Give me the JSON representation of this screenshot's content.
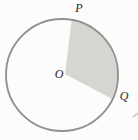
{
  "figure": {
    "labels": {
      "p": "P",
      "o": "O",
      "q": "Q"
    },
    "colors": {
      "circle_stroke": "#919191",
      "sector_fill": "#d6d5d2",
      "label_color": "#1f1f1f",
      "background": "#fcfcfb"
    }
  }
}
